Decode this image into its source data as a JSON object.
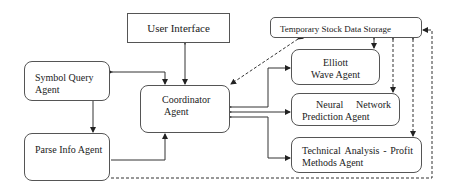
{
  "diagram": {
    "nodes": {
      "user_interface": "User Interface",
      "temp_storage": "Temporary Stock Data Storage",
      "symbol_query": [
        "Symbol Query",
        "Agent"
      ],
      "parse_info": "Parse Info Agent",
      "coordinator": [
        "Coordinator",
        "Agent"
      ],
      "elliott": [
        "Elliott",
        "Wave Agent"
      ],
      "neural": [
        "Neural",
        "Network",
        "Prediction Agent"
      ],
      "technical": [
        "Technical",
        "Analysis",
        "-",
        "Profit",
        "Methods Agent"
      ]
    },
    "edges": [
      {
        "from": "User Interface",
        "to": "Coordinator Agent",
        "style": "solid",
        "direction": "both"
      },
      {
        "from": "Symbol Query Agent",
        "to": "Coordinator Agent",
        "style": "solid",
        "direction": "both"
      },
      {
        "from": "Symbol Query Agent",
        "to": "Parse Info Agent",
        "style": "solid",
        "direction": "forward"
      },
      {
        "from": "Parse Info Agent",
        "to": "Coordinator Agent",
        "style": "solid",
        "direction": "forward"
      },
      {
        "from": "Coordinator Agent",
        "to": "Elliott Wave Agent",
        "style": "solid",
        "direction": "both"
      },
      {
        "from": "Coordinator Agent",
        "to": "Neural Network Prediction Agent",
        "style": "solid",
        "direction": "both"
      },
      {
        "from": "Coordinator Agent",
        "to": "Technical Analysis - Profit Methods Agent",
        "style": "solid",
        "direction": "both"
      },
      {
        "from": "Temporary Stock Data Storage",
        "to": "Coordinator Agent",
        "style": "dashed",
        "direction": "both"
      },
      {
        "from": "Temporary Stock Data Storage",
        "to": "Elliott Wave Agent",
        "style": "solid",
        "direction": "both"
      },
      {
        "from": "Temporary Stock Data Storage",
        "to": "Neural Network Prediction Agent",
        "style": "dashed",
        "direction": "both"
      },
      {
        "from": "Temporary Stock Data Storage",
        "to": "Technical Analysis - Profit Methods Agent",
        "style": "dashed",
        "direction": "both"
      },
      {
        "from": "Parse Info Agent",
        "to": "Temporary Stock Data Storage",
        "style": "dashed",
        "direction": "forward"
      }
    ]
  }
}
